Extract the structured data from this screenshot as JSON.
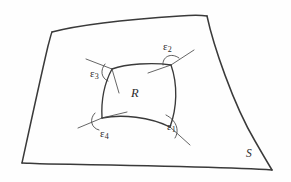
{
  "figure": {
    "kind": "hand-drawn-geometry-sketch",
    "background_color": "#fefefe",
    "ink_color": "#3a3a3a",
    "surface_label": "S",
    "region_label": "R",
    "angle_labels": [
      {
        "id": "epsilon-1",
        "symbol": "ε",
        "subscript": "1",
        "corner": "bottom-right"
      },
      {
        "id": "epsilon-2",
        "symbol": "ε",
        "subscript": "2",
        "corner": "top-right"
      },
      {
        "id": "epsilon-3",
        "symbol": "ε",
        "subscript": "3",
        "corner": "top-left"
      },
      {
        "id": "epsilon-4",
        "symbol": "ε",
        "subscript": "4",
        "corner": "bottom-left"
      }
    ]
  }
}
